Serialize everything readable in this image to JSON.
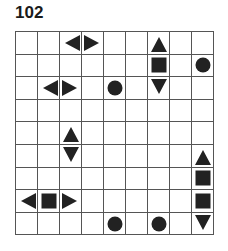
{
  "puzzle": {
    "number": "102",
    "rows": 9,
    "cols": 9,
    "pieces": [
      {
        "row": 0,
        "col": 2,
        "shape": "left"
      },
      {
        "row": 0,
        "col": 3,
        "shape": "right"
      },
      {
        "row": 0,
        "col": 6,
        "shape": "up"
      },
      {
        "row": 1,
        "col": 6,
        "shape": "square"
      },
      {
        "row": 1,
        "col": 8,
        "shape": "circle"
      },
      {
        "row": 2,
        "col": 1,
        "shape": "left"
      },
      {
        "row": 2,
        "col": 2,
        "shape": "right"
      },
      {
        "row": 2,
        "col": 4,
        "shape": "circle"
      },
      {
        "row": 2,
        "col": 6,
        "shape": "down"
      },
      {
        "row": 4,
        "col": 2,
        "shape": "up"
      },
      {
        "row": 5,
        "col": 2,
        "shape": "down"
      },
      {
        "row": 5,
        "col": 8,
        "shape": "up"
      },
      {
        "row": 6,
        "col": 8,
        "shape": "square"
      },
      {
        "row": 7,
        "col": 0,
        "shape": "left"
      },
      {
        "row": 7,
        "col": 1,
        "shape": "square"
      },
      {
        "row": 7,
        "col": 2,
        "shape": "right"
      },
      {
        "row": 7,
        "col": 8,
        "shape": "square"
      },
      {
        "row": 8,
        "col": 4,
        "shape": "circle"
      },
      {
        "row": 8,
        "col": 6,
        "shape": "circle"
      },
      {
        "row": 8,
        "col": 8,
        "shape": "down"
      }
    ]
  }
}
